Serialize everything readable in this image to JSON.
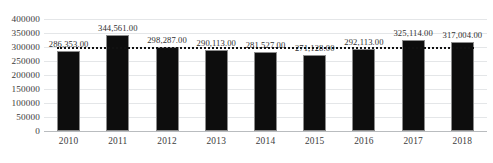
{
  "chart_data": {
    "type": "bar",
    "title": "",
    "subtitle": "",
    "xlabel": "",
    "ylabel": "",
    "categories": [
      "2010",
      "2011",
      "2012",
      "2013",
      "2014",
      "2015",
      "2016",
      "2017",
      "2018"
    ],
    "values": [
      286353,
      344561,
      298287,
      290113,
      281527,
      271128,
      292113,
      325114,
      317004
    ],
    "data_labels": [
      "286,353.00",
      "344,561.00",
      "298,287.00",
      "290,113.00",
      "281,527.00",
      "271,128.00",
      "292,113.00",
      "325,114.00",
      "317,004.00"
    ],
    "ylim": [
      0,
      400000
    ],
    "ytick_values": [
      400000,
      350000,
      300000,
      250000,
      200000,
      150000,
      100000,
      50000,
      0
    ],
    "ytick_labels": [
      "400000",
      "350000",
      "300000",
      "250000",
      "200000",
      "150000",
      "100000",
      "50000",
      "0"
    ],
    "grid": true,
    "legend": null,
    "series": [
      {
        "name": "series-1",
        "values": [
          286353,
          344561,
          298287,
          290113,
          281527,
          271128,
          292113,
          325114,
          317004
        ],
        "color": "#0d0d0d"
      }
    ],
    "trendline": {
      "type": "linear",
      "style": "dotted",
      "color": "#111111",
      "value": 300700,
      "start_value": 300700,
      "end_value": 300700
    },
    "colors": {
      "bar": "#0d0d0d",
      "bar_outline": "#8c8c8c",
      "gridline": "#e4e6e8",
      "axis": "#b9bcbf",
      "text": "#3b3b3b",
      "background": "#ffffff"
    }
  }
}
